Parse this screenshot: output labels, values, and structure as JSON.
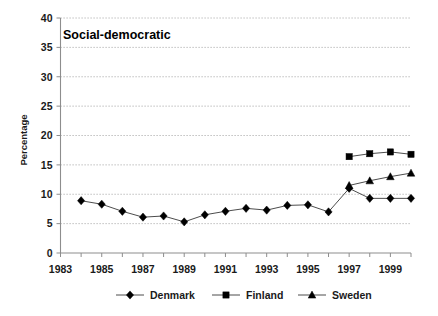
{
  "chart_data": {
    "type": "line",
    "title": "Social-democratic",
    "xlabel": "",
    "ylabel": "Percentage",
    "ylim": [
      0,
      40
    ],
    "ytick_step": 5,
    "yticks": [
      0,
      5,
      10,
      15,
      20,
      25,
      30,
      35,
      40
    ],
    "xlim": [
      1983,
      2000
    ],
    "xticks": [
      1983,
      1984,
      1985,
      1986,
      1987,
      1988,
      1989,
      1990,
      1991,
      1992,
      1993,
      1994,
      1995,
      1996,
      1997,
      1998,
      1999,
      2000
    ],
    "xtick_labels": [
      "1983",
      "",
      "1985",
      "",
      "1987",
      "",
      "1989",
      "",
      "1991",
      "",
      "1993",
      "",
      "1995",
      "",
      "1997",
      "",
      "1999",
      ""
    ],
    "xtick_labels_shown": [
      "1983",
      "1985",
      "1987",
      "1989",
      "1991",
      "1993",
      "1995",
      "1997",
      "1999"
    ],
    "grid": "horizontal-dotted",
    "legend_position": "bottom",
    "series": [
      {
        "name": "Denmark",
        "marker": "diamond",
        "color": "#000000",
        "x": [
          1984,
          1985,
          1986,
          1987,
          1988,
          1989,
          1990,
          1991,
          1992,
          1993,
          1994,
          1995,
          1996,
          1997,
          1998,
          1999,
          2000
        ],
        "values": [
          8.9,
          8.3,
          7.1,
          6.1,
          6.3,
          5.3,
          6.5,
          7.1,
          7.6,
          7.3,
          8.1,
          8.2,
          7.0,
          11.0,
          9.3,
          9.3,
          9.3
        ]
      },
      {
        "name": "Finland",
        "marker": "square",
        "color": "#000000",
        "x": [
          1997,
          1998,
          1999,
          2000
        ],
        "values": [
          16.4,
          16.9,
          17.2,
          16.8
        ]
      },
      {
        "name": "Sweden",
        "marker": "triangle",
        "color": "#000000",
        "x": [
          1997,
          1998,
          1999,
          2000
        ],
        "values": [
          11.5,
          12.3,
          13.0,
          13.6
        ]
      }
    ]
  },
  "legend": {
    "items": [
      {
        "label": "Denmark",
        "marker": "diamond"
      },
      {
        "label": "Finland",
        "marker": "square"
      },
      {
        "label": "Sweden",
        "marker": "triangle"
      }
    ]
  }
}
